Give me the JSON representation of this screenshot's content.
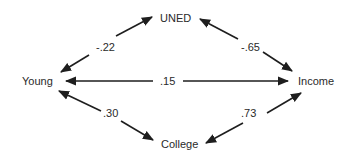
{
  "nodes": {
    "uned": "UNED",
    "young": "Young",
    "income": "Income",
    "college": "College"
  },
  "edges": {
    "young_uned": "-.22",
    "uned_income": "-.65",
    "young_income": ".15",
    "young_college": ".30",
    "college_income": ".73"
  },
  "colors": {
    "line": "#1e1e1e",
    "text": "#2a2a2a",
    "background": "#ffffff"
  }
}
